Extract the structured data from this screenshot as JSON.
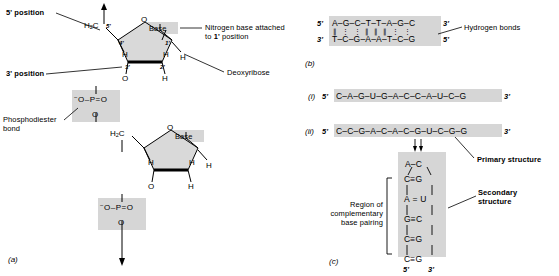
{
  "figure": {
    "panel_a": {
      "letter": "(a)",
      "labels": {
        "five_prime_position": "5' position",
        "three_prime_position": "3' position",
        "phosphodiester_bond": "Phosphodiester\nbond",
        "nitrogen_base": "Nitrogen base attached\nto 1' position",
        "deoxyribose": "Deoxyribose",
        "base_top": "Base",
        "base_bottom": "Base"
      },
      "sugar_positions": [
        "5'",
        "4'",
        "3'",
        "2'",
        "1'"
      ],
      "atoms": {
        "ring_oxygen": "O",
        "h2c": "H",
        "h2c_sub": "2",
        "h2c_c": "C",
        "hydrogen": "H",
        "oxygen": "O",
        "phosphate_left": "O",
        "phosphate_p": "P",
        "phosphate_right": "O",
        "phosphate_minus": "−",
        "bond_dash": "–",
        "double_bond": "="
      }
    },
    "panel_b": {
      "letter": "(b)",
      "label_hydrogen_bonds": "Hydrogen bonds",
      "top_end_left": "5'",
      "top_end_right": "3'",
      "bottom_end_left": "3'",
      "bottom_end_right": "5'",
      "top_strand": [
        "A",
        "G",
        "C",
        "T",
        "T",
        "A",
        "G",
        "C"
      ],
      "bottom_strand": [
        "T",
        "C",
        "G",
        "A",
        "A",
        "T",
        "C",
        "G"
      ],
      "hydrogen_bond_counts": [
        2,
        3,
        3,
        2,
        2,
        2,
        3,
        3
      ]
    },
    "panel_c": {
      "letter": "(c)",
      "item_i_label": "(i)",
      "item_ii_label": "(ii)",
      "seq_i": {
        "five_end": "5'",
        "three_end": "3'",
        "bases": [
          "C",
          "A",
          "G",
          "U",
          "G",
          "A",
          "C",
          "C",
          "A",
          "U",
          "C",
          "G"
        ]
      },
      "seq_ii": {
        "five_end": "5'",
        "three_end": "3'",
        "bases": [
          "C",
          "C",
          "G",
          "A",
          "C",
          "A",
          "C",
          "G",
          "U",
          "C",
          "G",
          "G"
        ]
      },
      "hairpin": {
        "loop_left": "A",
        "loop_right": "C",
        "loop_dash": "–",
        "stem": [
          {
            "left": "C",
            "bond": "≡",
            "right": "G"
          },
          {
            "left": "A",
            "bond": "=",
            "right": "U"
          },
          {
            "left": "G",
            "bond": "≡",
            "right": "C"
          },
          {
            "left": "C",
            "bond": "≡",
            "right": "G"
          },
          {
            "left": "C",
            "bond": "≡",
            "right": "G"
          }
        ],
        "five_end": "5'",
        "three_end": "3'"
      },
      "label_region": "Region of\ncomplementary\nbase pairing",
      "label_primary": "Primary structure",
      "label_secondary": "Secondary\nstructure"
    }
  },
  "colors": {
    "shade": "#d6d6d6",
    "ring_fill": "#d9d9d9",
    "stroke": "#000000",
    "background": "#ffffff"
  }
}
